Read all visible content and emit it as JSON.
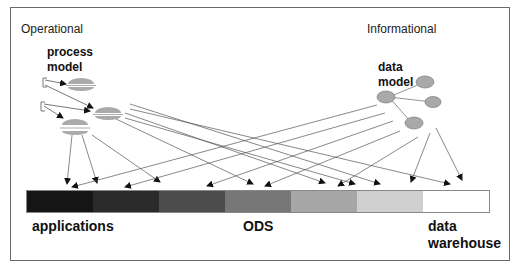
{
  "diagram": {
    "sections": {
      "operational": {
        "title": "Operational",
        "model_label_line1": "process",
        "model_label_line2": "model"
      },
      "informational": {
        "title": "Informational",
        "model_label_line1": "data",
        "model_label_line2": "model"
      }
    },
    "bar": {
      "segments": [
        {
          "name": "segment-1",
          "color": "#151515"
        },
        {
          "name": "segment-2",
          "color": "#2a2a2a"
        },
        {
          "name": "segment-3",
          "color": "#4c4c4c"
        },
        {
          "name": "segment-4",
          "color": "#777777"
        },
        {
          "name": "segment-5",
          "color": "#a6a6a6"
        },
        {
          "name": "segment-6",
          "color": "#cfcfcf"
        },
        {
          "name": "segment-7",
          "color": "#ffffff"
        }
      ],
      "labels": {
        "left": "applications",
        "middle": "ODS",
        "right_line1": "data",
        "right_line2": "warehouse"
      }
    },
    "colors": {
      "frame": "#6a6a6a",
      "arrow": "#444444",
      "node_fill": "#a9a9a9",
      "node_stroke": "#7a7a7a"
    }
  }
}
